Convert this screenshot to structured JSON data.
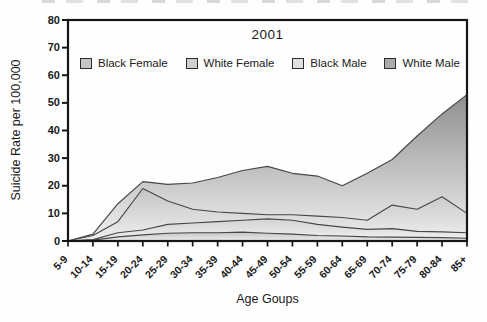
{
  "chart_data": {
    "type": "area",
    "overlapping": true,
    "title": "2001",
    "xlabel": "Age Goups",
    "ylabel": "Suicide Rate per 100,000",
    "ylim": [
      0,
      80
    ],
    "y_ticks": [
      0,
      10,
      20,
      30,
      40,
      50,
      60,
      70,
      80
    ],
    "grid": false,
    "legend_position": "top-inside-horizontal",
    "categories": [
      "5-9",
      "10-14",
      "15-19",
      "20-24",
      "25-29",
      "30-34",
      "35-39",
      "40-44",
      "45-49",
      "50-54",
      "55-59",
      "60-64",
      "65-69",
      "70-74",
      "75-79",
      "80-84",
      "85+"
    ],
    "series": [
      {
        "name": "Black Female",
        "swatch_color": "#c6c6c6",
        "fill_top": "#c6c6c6",
        "fill_bottom": "#ececec",
        "values": [
          0,
          0.3,
          1.5,
          2.2,
          2.8,
          3,
          3,
          3.2,
          2.8,
          2.5,
          2,
          1.8,
          1.5,
          1.4,
          1.3,
          1.2,
          1
        ]
      },
      {
        "name": "White Female",
        "swatch_color": "#cecece",
        "fill_top": "#d2d2d2",
        "fill_bottom": "#f2f2f2",
        "values": [
          0,
          0.5,
          3,
          4,
          6,
          6.5,
          7,
          7.5,
          8,
          7.5,
          6,
          5,
          4.2,
          4.5,
          3.5,
          3.3,
          3
        ]
      },
      {
        "name": "Black Male",
        "swatch_color": "#e0e0e0",
        "fill_top": "#c4c4c4",
        "fill_bottom": "#f0f0f0",
        "values": [
          0,
          2,
          7,
          19,
          14.5,
          11.5,
          10.5,
          10,
          9.5,
          9.5,
          9,
          8.5,
          7.5,
          13,
          11.5,
          16,
          10
        ]
      },
      {
        "name": "White Male",
        "swatch_color": "#ababab",
        "fill_top": "#8f8f8f",
        "fill_bottom": "#f0f0f0",
        "values": [
          0,
          2.5,
          13.5,
          21.5,
          20.5,
          21,
          23,
          25.5,
          27,
          24.5,
          23.5,
          20,
          24.5,
          29.5,
          38,
          46,
          53
        ]
      }
    ],
    "axis_color": "#161616",
    "line_color": "#474747"
  }
}
